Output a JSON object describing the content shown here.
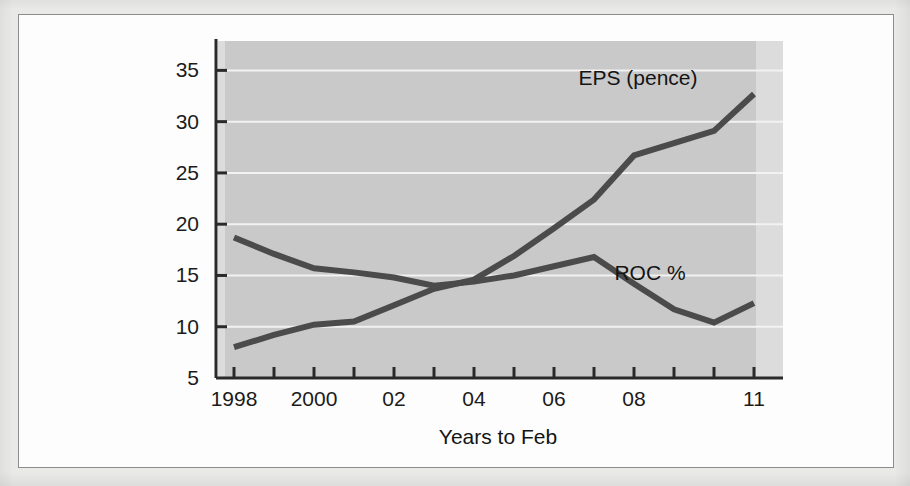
{
  "figure": {
    "background_color": "#fdfdfd",
    "page_color": "#e9e9e7",
    "frame_color": "#8d8d8d"
  },
  "chart_data": {
    "type": "line",
    "title": "",
    "subtitle": "",
    "xlabel": "Years to Feb",
    "ylabel": "",
    "xlim": [
      1997.35,
      2011.8
    ],
    "ylim": [
      5,
      36.5
    ],
    "grid": true,
    "grid_orientation": "horizontal",
    "legend_position": "inline-annotation",
    "plot_band_color": "#c9c9c9",
    "plot_band_edge_color": "#dcdcdc",
    "gridline_color": "#f2f2f2",
    "axis_color": "#2a2a2a",
    "line_color": "#4b4b4b",
    "line_width": 6,
    "x": [
      1998,
      1999,
      2000,
      2001,
      2002,
      2003,
      2004,
      2005,
      2006,
      2007,
      2008,
      2009,
      2010,
      2011
    ],
    "x_tick_values": [
      1998,
      1999,
      2000,
      2001,
      2002,
      2003,
      2004,
      2005,
      2006,
      2007,
      2008,
      2009,
      2010,
      2011
    ],
    "x_tick_labels": [
      "1998",
      "",
      "2000",
      "",
      "02",
      "",
      "04",
      "",
      "06",
      "",
      "08",
      "",
      "",
      "11"
    ],
    "y_ticks": [
      5,
      10,
      15,
      20,
      25,
      30,
      35
    ],
    "y_tick_labels": [
      "5",
      "10",
      "15",
      "20",
      "25",
      "30",
      "35"
    ],
    "series": [
      {
        "name": "EPS (pence)",
        "label": "EPS (pence)",
        "label_x": 2008.1,
        "label_y": 33.6,
        "values": [
          8.0,
          9.2,
          10.2,
          10.5,
          12.1,
          13.7,
          14.6,
          16.9,
          19.6,
          22.4,
          26.7,
          27.9,
          29.1,
          32.7
        ]
      },
      {
        "name": "ROC %",
        "label": "ROC %",
        "label_x": 2008.4,
        "label_y": 14.6,
        "values": [
          18.7,
          17.1,
          15.7,
          15.3,
          14.8,
          14.0,
          14.4,
          15.0,
          15.9,
          16.8,
          14.2,
          11.7,
          10.4,
          12.3
        ]
      }
    ]
  }
}
